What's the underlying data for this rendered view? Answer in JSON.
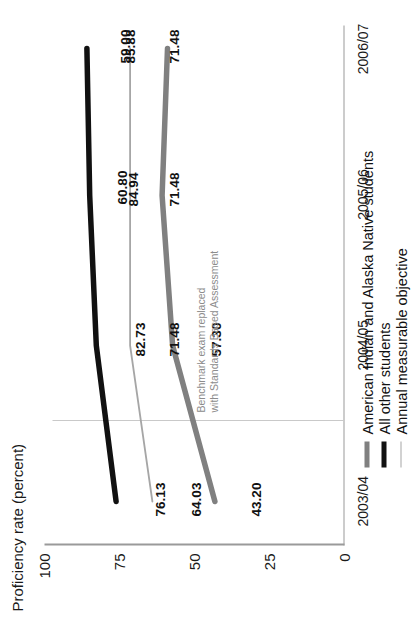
{
  "chart_data": {
    "type": "line",
    "title": "",
    "xlabel": "",
    "ylabel": "Proficiency rate (percent)",
    "categories": [
      "2003/04",
      "2004/05",
      "2005/06",
      "2006/07"
    ],
    "ylim": [
      0,
      100
    ],
    "yticks": [
      "0",
      "25",
      "50",
      "75",
      "100"
    ],
    "grid": false,
    "legend_position": "bottom-left",
    "series": [
      {
        "name": "American Indian and Alaska Native students",
        "color": "#808080",
        "values": [
          43.2,
          57.3,
          60.8,
          59.0
        ],
        "labels": [
          "43.20",
          "57.30",
          "60.80",
          "59.00"
        ]
      },
      {
        "name": "All other students",
        "color": "#111111",
        "values": [
          76.13,
          82.73,
          84.94,
          85.88
        ],
        "labels": [
          "76.13",
          "82.73",
          "84.94",
          "85.88"
        ]
      },
      {
        "name": "Annual measurable objective",
        "color": "#a6a6a6",
        "values": [
          64.03,
          71.48,
          71.48,
          71.48
        ],
        "labels": [
          "64.03",
          "71.48",
          "71.48",
          "71.48"
        ]
      }
    ],
    "annotations": [
      {
        "line1": "Benchmark exam replaced",
        "line2": "with Standards Based Assessment",
        "color": "#8c8c8c"
      }
    ]
  },
  "axis": {
    "y_label": "Proficiency rate (percent)",
    "y_ticks": [
      "100",
      "75",
      "50",
      "25",
      "0"
    ],
    "x_ticks": [
      "2003/04",
      "2004/05",
      "2005/06",
      "2006/07"
    ]
  },
  "legend": {
    "items": [
      {
        "label": "American Indian and Alaska Native students",
        "color": "#808080"
      },
      {
        "label": "All other students",
        "color": "#111111"
      },
      {
        "label": "Annual measurable objective",
        "color": "#a6a6a6"
      }
    ]
  },
  "annotation": {
    "line1": "Benchmark exam replaced",
    "line2": "with Standards Based Assessment"
  },
  "labels": {
    "aian": [
      "43.20",
      "57.30",
      "60.80",
      "59.00"
    ],
    "all_other": [
      "76.13",
      "82.73",
      "84.94",
      "85.88"
    ],
    "amo": [
      "64.03",
      "71.48",
      "71.48",
      "71.48"
    ]
  }
}
